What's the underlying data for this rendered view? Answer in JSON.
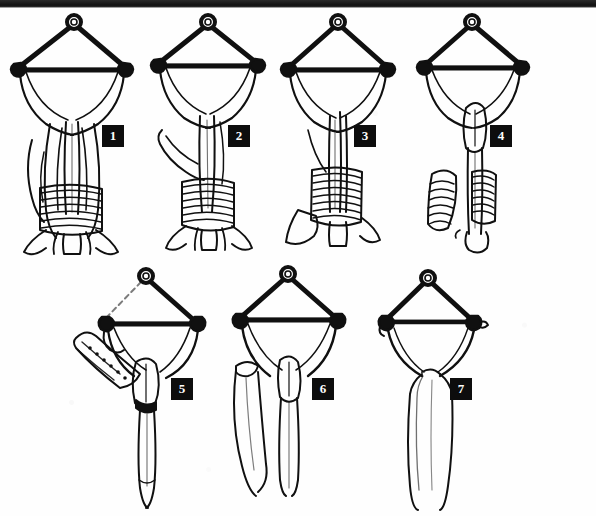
{
  "plate": {
    "background_color": "#fefefe",
    "ink_color": "#101010",
    "badge_bg": "#0d0d0d",
    "badge_fg": "#fdfdfd",
    "scan_edge_color": "#1b1b1b",
    "width": 596,
    "height": 516
  },
  "figures": [
    {
      "number": "1",
      "badge_x": 103,
      "badge_y": 126,
      "description": "Bow brooch with suspension ring at apex, two spiral knobs on crossbar, broad triangular body, long central pin with paired flanking blades, horizontal hatched band low on shaft and splayed forked foot"
    },
    {
      "number": "2",
      "badge_x": 229,
      "badge_y": 126,
      "description": "Bow brooch with suspension ring, crossbar knobs, single curved side blade on left, central shaft with hatched sleeve and forked splayed foot"
    },
    {
      "number": "3",
      "badge_x": 355,
      "badge_y": 126,
      "description": "Bow brooch with suspension ring, crossbar knobs, narrow central shaft with hatched sleeve, detached triangular blade at lower left and splayed foot"
    },
    {
      "number": "4",
      "badge_x": 491,
      "badge_y": 126,
      "description": "Bow brooch with suspension ring, crossbar knobs, lens-shaped boss at junction, straight shaft with hatched sleeve and detached hatched blade at left"
    },
    {
      "number": "5",
      "badge_x": 172,
      "badge_y": 379,
      "description": "Bow brooch with suspension ring, left crossbar knob with attached angled hatched blade bearing dotted row, lens-shaped boss and long tapering pin"
    },
    {
      "number": "6",
      "badge_x": 313,
      "badge_y": 379,
      "description": "Bow brooch with suspension ring and crossbar knobs, lens-shaped boss, long tapering pin and a separate detached tapering blade at left"
    },
    {
      "number": "7",
      "badge_x": 451,
      "badge_y": 379,
      "description": "Bow brooch with suspension ring and crossbar knobs, plain curved bow and single long tapering pin"
    }
  ]
}
